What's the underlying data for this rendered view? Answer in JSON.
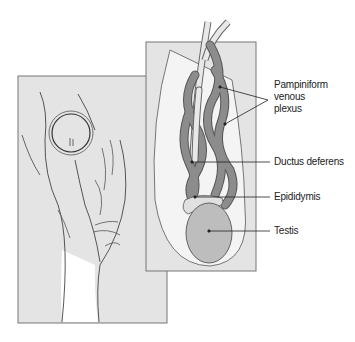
{
  "figure": {
    "colors": {
      "panel_bg": "#e4e4e4",
      "panel_border": "#777777",
      "vein_fill": "#8c8c8c",
      "testis_fill": "#bdbdbd",
      "line": "#333333"
    }
  },
  "labels": {
    "pampiniform_1": "Pampiniform",
    "pampiniform_2": "venous",
    "pampiniform_3": "plexus",
    "ductus": "Ductus deferens",
    "epididymis": "Epididymis",
    "testis": "Testis"
  }
}
